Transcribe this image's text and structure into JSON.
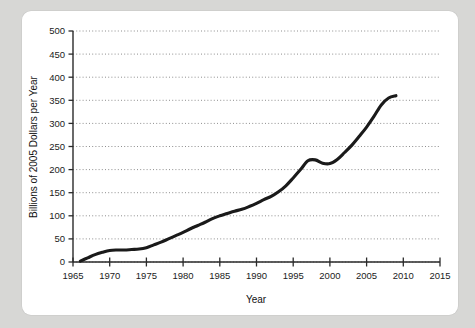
{
  "figure": {
    "background_color": "#d7d7d5",
    "panel_color": "#ffffff"
  },
  "chart_data": {
    "type": "line",
    "title": "",
    "xlabel": "Year",
    "ylabel": "Billions of 2005 Dollars per Year",
    "xlim": [
      1965,
      2015
    ],
    "ylim": [
      0,
      500
    ],
    "grid": "horizontal-dotted",
    "legend": "none",
    "line_color": "#1a1a1a",
    "xticks": [
      1965,
      1970,
      1975,
      1980,
      1985,
      1990,
      1995,
      2000,
      2005,
      2010,
      2015
    ],
    "xtick_labels": [
      "1965",
      "1970",
      "1975",
      "1980",
      "1985",
      "1990",
      "1995",
      "2000",
      "2005",
      "2010",
      "2015"
    ],
    "yticks": [
      0,
      50,
      100,
      150,
      200,
      250,
      300,
      350,
      400,
      450,
      500
    ],
    "ytick_labels": [
      "0",
      "50",
      "100",
      "150",
      "200",
      "250",
      "300",
      "350",
      "400",
      "450",
      "500"
    ],
    "x": [
      1966.0,
      1967.0,
      1968.0,
      1969.0,
      1970.0,
      1971.0,
      1972.0,
      1973.0,
      1974.0,
      1975.0,
      1976.0,
      1977.0,
      1978.0,
      1979.0,
      1980.0,
      1981.0,
      1982.0,
      1983.0,
      1984.0,
      1985.0,
      1986.0,
      1987.0,
      1988.0,
      1989.0,
      1990.0,
      1991.0,
      1992.0,
      1993.0,
      1994.0,
      1995.0,
      1996.0,
      1997.0,
      1998.0,
      1999.0,
      2000.0,
      2001.0,
      2002.0,
      2003.0,
      2004.0,
      2005.0,
      2006.0,
      2007.0,
      2008.0,
      2009.0
    ],
    "values": [
      2,
      9,
      16,
      21,
      25,
      26,
      26,
      27,
      28,
      31,
      37,
      43,
      50,
      57,
      64,
      72,
      79,
      86,
      94,
      100,
      105,
      110,
      114,
      120,
      127,
      135,
      142,
      152,
      165,
      182,
      200,
      219,
      221,
      214,
      213,
      222,
      237,
      253,
      272,
      292,
      315,
      340,
      355,
      360
    ],
    "series_name": "Billions of 2005 Dollars per Year"
  }
}
